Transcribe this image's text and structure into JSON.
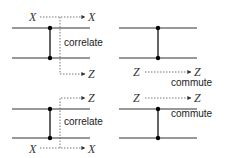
{
  "panels": [
    {
      "id": "top-left",
      "input_label": "X",
      "output_top_label": "X",
      "output_bottom_label": "Z",
      "caption": "correlate"
    },
    {
      "id": "top-right",
      "input_label": "Z",
      "output_label": "Z",
      "caption": "commute"
    },
    {
      "id": "bottom-left",
      "input_label": "X",
      "output_top_label": "Z",
      "output_bottom_label": "X",
      "caption": "correlate"
    },
    {
      "id": "bottom-right",
      "input_label": "Z",
      "output_label": "Z",
      "caption": "commute"
    }
  ]
}
